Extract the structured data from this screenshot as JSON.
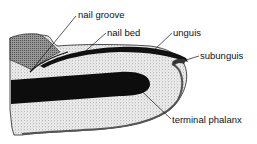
{
  "diagram": {
    "labels": [
      {
        "id": "nail-groove",
        "text": "nail groove",
        "x": 78,
        "y": 10,
        "target": [
          30,
          72
        ]
      },
      {
        "id": "nail-bed",
        "text": "nail bed",
        "x": 107,
        "y": 28,
        "target": [
          80,
          56
        ]
      },
      {
        "id": "unguis",
        "text": "unguis",
        "x": 173,
        "y": 28,
        "target": [
          152,
          52
        ]
      },
      {
        "id": "subunguis",
        "text": "subunguis",
        "x": 200,
        "y": 51,
        "target": [
          186,
          60
        ]
      },
      {
        "id": "terminal-phalanx",
        "text": "terminal phalanx",
        "x": 172,
        "y": 115,
        "target": [
          132,
          82
        ]
      }
    ],
    "colors": {
      "ink": "#111111",
      "stipple_light": "#d9d9d9",
      "stipple_mid": "#9a9a9a",
      "background": "#ffffff"
    }
  }
}
